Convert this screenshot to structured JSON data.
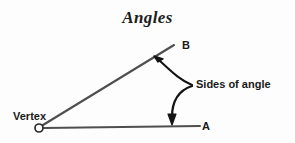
{
  "figure": {
    "title": "Angles",
    "background_color": "#fdfdfd",
    "line_color": "#4a4a4a",
    "ink_color": "#1a1a1a"
  },
  "labels": {
    "point_b": "B",
    "point_a": "A",
    "vertex": "Vertex",
    "sides_of_angle": "Sides of angle"
  },
  "geometry": {
    "vertex_point": {
      "x": 39,
      "y": 128,
      "radius": 4
    },
    "ray_a": {
      "x1": 44,
      "y1": 128,
      "x2": 200,
      "y2": 126
    },
    "ray_b": {
      "x1": 42,
      "y1": 126,
      "x2": 174,
      "y2": 45
    },
    "callout_origin": {
      "x": 192,
      "y": 85
    },
    "arrow_up_tip": {
      "x": 155,
      "y": 58
    },
    "arrow_down_tip": {
      "x": 172,
      "y": 124
    }
  },
  "icons": {
    "vertex_point": "open-circle-icon",
    "arrow_to_upper_side": "curved-arrow-up-left-icon",
    "arrow_to_lower_side": "curved-arrow-down-icon"
  }
}
